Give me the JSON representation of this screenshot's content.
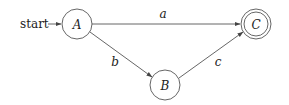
{
  "diagram": {
    "type": "finite-automaton",
    "start_label": "start",
    "nodes": [
      {
        "id": "A",
        "label": "A",
        "accepting": false,
        "start": true
      },
      {
        "id": "B",
        "label": "B",
        "accepting": false,
        "start": false
      },
      {
        "id": "C",
        "label": "C",
        "accepting": true,
        "start": false
      }
    ],
    "edges": [
      {
        "from": "A",
        "to": "C",
        "label": "a"
      },
      {
        "from": "A",
        "to": "B",
        "label": "b"
      },
      {
        "from": "B",
        "to": "C",
        "label": "c"
      }
    ],
    "colors": {
      "stroke": "#555555",
      "text": "#222222",
      "background": "#ffffff"
    }
  }
}
